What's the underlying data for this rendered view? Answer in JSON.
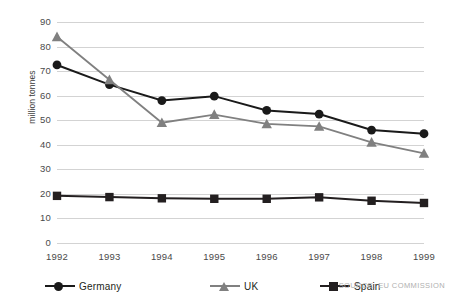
{
  "chart_data": {
    "type": "line",
    "title": "",
    "xlabel": "",
    "ylabel": "million tonnes",
    "categories": [
      "1992",
      "1993",
      "1994",
      "1995",
      "1996",
      "1997",
      "1998",
      "1999"
    ],
    "x": [
      1992,
      1993,
      1994,
      1995,
      1996,
      1997,
      1998,
      1999
    ],
    "ylim": [
      0,
      90
    ],
    "ytick_values": [
      0,
      10,
      20,
      30,
      40,
      50,
      60,
      70,
      80,
      90
    ],
    "ytick_labels": [
      "0",
      "10",
      "20",
      "30",
      "40",
      "50",
      "60",
      "70",
      "80",
      "90"
    ],
    "grid": true,
    "legend_position": "bottom",
    "series": [
      {
        "name": "Germany",
        "marker": "circle",
        "color": "#1a1a1a",
        "values": [
          72.5,
          64.5,
          58.0,
          59.8,
          54.0,
          52.5,
          46.0,
          44.5
        ]
      },
      {
        "name": "UK",
        "marker": "triangle",
        "color": "#808080",
        "values": [
          84.0,
          66.5,
          49.0,
          52.3,
          48.5,
          47.5,
          41.0,
          36.5
        ]
      },
      {
        "name": "Spain",
        "marker": "square",
        "color": "#231f20",
        "values": [
          19.2,
          18.7,
          18.2,
          18.0,
          18.0,
          18.6,
          17.2,
          16.3
        ]
      }
    ],
    "annotations": {
      "source": "SOURCE: EU COMMISSION"
    }
  },
  "colors": {
    "gridline": "#d3d3d3",
    "axis_text": "#4a4a4a",
    "germany": "#1a1a1a",
    "uk": "#808080",
    "spain": "#231f20",
    "source_text": "#b0b0b0"
  }
}
